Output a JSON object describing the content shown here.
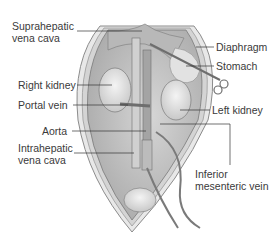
{
  "figure": {
    "labels": {
      "suprahepatic_line1": "Suprahepatic",
      "suprahepatic_line2": "vena cava",
      "diaphragm": "Diaphragm",
      "stomach": "Stomach",
      "right_kidney": "Right kidney",
      "portal_vein": "Portal vein",
      "left_kidney": "Left kidney",
      "aorta": "Aorta",
      "intrahepatic_line1": "Intrahepatic",
      "intrahepatic_line2": "vena cava",
      "inferior_line1": "Inferior",
      "inferior_line2": "mesenteric vein"
    },
    "colors": {
      "body_wall": "#d8d8d8",
      "cavity": "#bdbdbd",
      "organ_light": "#e6e6e6",
      "vessel": "#8a8a8a",
      "leader": "#333333"
    }
  }
}
